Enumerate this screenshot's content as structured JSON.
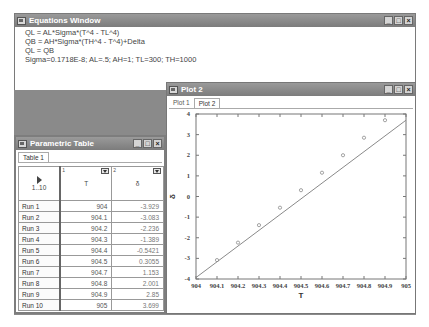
{
  "equations_window": {
    "title": "Equations Window",
    "lines": [
      "QL = AL*Sigma*(T^4 - TL^4)",
      "QB = AH*Sigma*(TH^4 - T^4)+Delta",
      "QL = QB",
      "Sigma=0.1718E-8; AL=.5; AH=1; TL=300; TH=1000"
    ],
    "buttons": {
      "minimize": "_",
      "maximize": "□",
      "close": "×"
    }
  },
  "parametric_table": {
    "title": "Parametric Table",
    "tabs": [
      {
        "label": "Table 1",
        "active": true
      }
    ],
    "header": {
      "run_range": "1..10",
      "columns": [
        {
          "index": "1",
          "name": "T"
        },
        {
          "index": "2",
          "name": "δ"
        }
      ]
    },
    "rows": [
      {
        "label": "Run 1",
        "T": "904",
        "delta": "-3.929"
      },
      {
        "label": "Run 2",
        "T": "904.1",
        "delta": "-3.083"
      },
      {
        "label": "Run 3",
        "T": "904.2",
        "delta": "-2.236"
      },
      {
        "label": "Run 4",
        "T": "904.3",
        "delta": "-1.389"
      },
      {
        "label": "Run 5",
        "T": "904.4",
        "delta": "-0.5421"
      },
      {
        "label": "Run 6",
        "T": "904.5",
        "delta": "0.3055"
      },
      {
        "label": "Run 7",
        "T": "904.7",
        "delta": "1.153"
      },
      {
        "label": "Run 8",
        "T": "904.8",
        "delta": "2.001"
      },
      {
        "label": "Run 9",
        "T": "904.9",
        "delta": "2.85"
      },
      {
        "label": "Run 10",
        "T": "905",
        "delta": "3.699"
      }
    ],
    "buttons": {
      "minimize": "_",
      "maximize": "□",
      "close": "×"
    }
  },
  "plot_window": {
    "title": "Plot 2",
    "tabs": [
      {
        "label": "Plot 1",
        "active": false
      },
      {
        "label": "Plot 2",
        "active": true
      }
    ],
    "buttons": {
      "minimize": "_",
      "maximize": "□",
      "close": "×"
    }
  },
  "chart_data": {
    "type": "line",
    "title": "",
    "xlabel": "T",
    "ylabel": "δ",
    "x": [
      904,
      904.1,
      904.2,
      904.3,
      904.4,
      904.5,
      904.6,
      904.7,
      904.8,
      904.9,
      905
    ],
    "series": [
      {
        "name": "δ",
        "x": [
          904,
          904.1,
          904.2,
          904.3,
          904.4,
          904.5,
          904.6,
          904.7,
          904.8,
          904.9,
          905
        ],
        "values": [
          -3.929,
          -3.083,
          -2.236,
          -1.389,
          -0.5421,
          0.3055,
          1.153,
          2.001,
          2.85,
          3.699,
          3.699
        ],
        "markers": "circle"
      }
    ],
    "xticks": [
      "904",
      "904.1",
      "904.2",
      "904.3",
      "904.4",
      "904.5",
      "904.6",
      "904.7",
      "904.8",
      "904.9",
      "905"
    ],
    "yticks": [
      "-4",
      "-3",
      "-2",
      "-1",
      "0",
      "1",
      "2",
      "3",
      "4"
    ],
    "xlim": [
      904,
      905
    ],
    "ylim": [
      -4,
      4
    ],
    "grid": false,
    "legend": "none"
  }
}
